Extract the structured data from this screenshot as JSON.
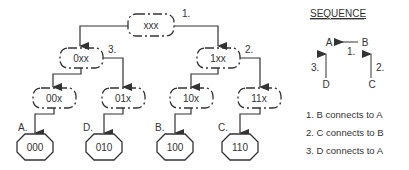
{
  "tree": {
    "root": {
      "label": "xxx",
      "step": "1."
    },
    "level1": [
      {
        "label": "0xx",
        "step": "3."
      },
      {
        "label": "1xx",
        "step": "2."
      }
    ],
    "level2": [
      {
        "label": "00x"
      },
      {
        "label": "01x"
      },
      {
        "label": "10x"
      },
      {
        "label": "11x"
      }
    ],
    "leaves": [
      {
        "label": "000",
        "letter": "A."
      },
      {
        "label": "010",
        "letter": "D."
      },
      {
        "label": "100",
        "letter": "B."
      },
      {
        "label": "110",
        "letter": "C."
      }
    ]
  },
  "sequence": {
    "title": "SEQUENCE",
    "nodes": {
      "a": "A",
      "b": "B",
      "c": "C",
      "d": "D"
    },
    "arrow_labels": {
      "ba": "1.",
      "cb": "2.",
      "da": "3."
    },
    "steps": [
      "1. B connects to A",
      "2. C connects to B",
      "3. D connects to A"
    ]
  },
  "colors": {
    "line": "#333333",
    "text": "#333333",
    "background": "#ffffff"
  }
}
